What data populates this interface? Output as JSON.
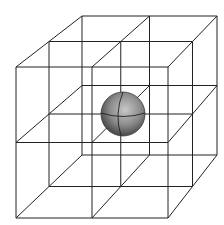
{
  "diagram": {
    "title": "",
    "colors": {
      "background": "#ffffff",
      "edge": "#222222",
      "sphere_light": "#c8c8c8",
      "sphere_mid": "#8a8a8a",
      "sphere_dark": "#3a3a3a"
    },
    "lattice": {
      "divisions": 2,
      "front_face": {
        "left": 16,
        "right": 168,
        "top": 67,
        "bottom": 218
      },
      "back_face": {
        "left": 82,
        "right": 217,
        "top": 16,
        "bottom": 155
      }
    },
    "sphere": {
      "cx": 123,
      "cy": 114,
      "r": 22
    }
  }
}
